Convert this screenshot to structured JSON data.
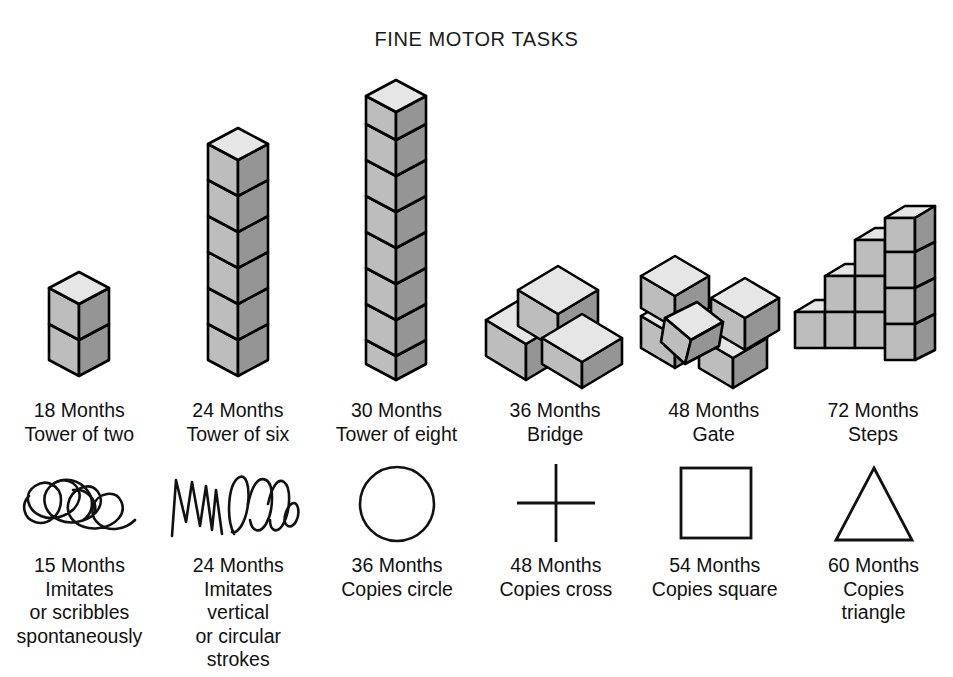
{
  "title": "FINE MOTOR TASKS",
  "colors": {
    "cube_top": "#e6e6e6",
    "cube_left": "#bdbdbd",
    "cube_right": "#959595",
    "outline": "#000000",
    "ink": "#111111",
    "background": "#ffffff"
  },
  "block_tasks": [
    {
      "age": "18 Months",
      "task": "Tower of two",
      "caption": "18 Months\nTower of two",
      "figure": "tower",
      "blocks": 2
    },
    {
      "age": "24 Months",
      "task": "Tower of six",
      "caption": "24 Months\nTower of six",
      "figure": "tower",
      "blocks": 6
    },
    {
      "age": "30 Months",
      "task": "Tower of eight",
      "caption": "30 Months\nTower of eight",
      "figure": "tower",
      "blocks": 8
    },
    {
      "age": "36 Months",
      "task": "Bridge",
      "caption": "36 Months\nBridge",
      "figure": "bridge",
      "blocks": 3
    },
    {
      "age": "48 Months",
      "task": "Gate",
      "caption": "48 Months\nGate",
      "figure": "gate",
      "blocks": 5
    },
    {
      "age": "72 Months",
      "task": "Steps",
      "caption": "72 Months\nSteps",
      "figure": "steps",
      "blocks": 10
    }
  ],
  "drawing_tasks": [
    {
      "age": "15 Months",
      "task": "Imitates or scribbles spontaneously",
      "caption": "15 Months\nImitates\nor scribbles\nspontaneously",
      "figure": "scribble"
    },
    {
      "age": "24 Months",
      "task": "Imitates vertical or circular strokes",
      "caption": "24 Months\nImitates\nvertical\nor circular\nstrokes",
      "figure": "strokes"
    },
    {
      "age": "36 Months",
      "task": "Copies circle",
      "caption": "36 Months\nCopies circle",
      "figure": "circle"
    },
    {
      "age": "48 Months",
      "task": "Copies cross",
      "caption": "48 Months\nCopies cross",
      "figure": "cross"
    },
    {
      "age": "54 Months",
      "task": "Copies square",
      "caption": "54 Months\nCopies square",
      "figure": "square"
    },
    {
      "age": "60 Months",
      "task": "Copies triangle",
      "caption": "60 Months\nCopies\ntriangle",
      "figure": "triangle"
    }
  ]
}
